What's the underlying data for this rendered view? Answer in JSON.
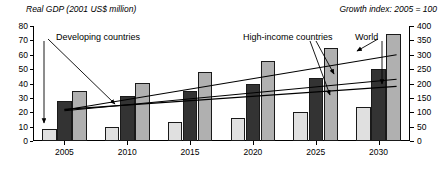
{
  "chart_data": {
    "type": "bar",
    "title": "",
    "title_left": "Real GDP (2001 US$ million)",
    "title_right": "Growth index: 2005 = 100",
    "categories": [
      "2005",
      "2010",
      "2015",
      "2020",
      "2025",
      "2030"
    ],
    "series": [
      {
        "name": "Developing countries",
        "values": [
          8.5,
          10,
          13.5,
          16,
          20,
          24
        ]
      },
      {
        "name": "High-income countries",
        "values": [
          27.5,
          31.5,
          34.5,
          39.5,
          44,
          50
        ]
      },
      {
        "name": "World",
        "values": [
          35,
          40.5,
          48,
          56,
          65,
          74.5
        ]
      }
    ],
    "xlabel": "",
    "ylabel": "Real GDP (2001 US$ million)",
    "ylim": [
      0,
      80
    ],
    "yticks": [
      0,
      10,
      20,
      30,
      40,
      50,
      60,
      70,
      80
    ],
    "y2label": "Growth index: 2005 = 100",
    "y2lim": [
      0,
      400
    ],
    "y2ticks": [
      0,
      50,
      100,
      150,
      200,
      250,
      300,
      350,
      400
    ],
    "grid": false,
    "legend": "annotations",
    "index_lines": [
      {
        "name": "Developing countries",
        "x": [
          "2005",
          "2030"
        ],
        "values": [
          108,
          300
        ]
      },
      {
        "name": "High-income countries",
        "x": [
          "2005",
          "2030"
        ],
        "values": [
          105,
          215
        ]
      },
      {
        "name": "World",
        "x": [
          "2005",
          "2030"
        ],
        "values": [
          110,
          190
        ]
      }
    ],
    "annotations": [
      {
        "label": "Developing countries",
        "target": "2005 light bar and index line"
      },
      {
        "label": "High-income countries",
        "target": "2025 index line"
      },
      {
        "label": "World",
        "target": "2025 and 2030 index lines"
      }
    ]
  },
  "axis": {
    "left_ticks": [
      "0",
      "10",
      "20",
      "30",
      "40",
      "50",
      "60",
      "70",
      "80"
    ],
    "right_ticks": [
      "0",
      "50",
      "100",
      "150",
      "200",
      "250",
      "300",
      "350",
      "400"
    ],
    "x_ticks": [
      "2005",
      "2010",
      "2015",
      "2020",
      "2025",
      "2030"
    ]
  },
  "labels": {
    "developing": "Developing countries",
    "high_income": "High-income countries",
    "world": "World"
  }
}
